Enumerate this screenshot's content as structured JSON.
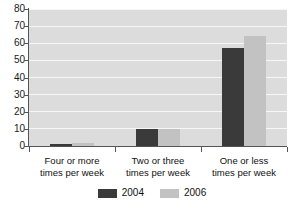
{
  "chart_data": {
    "type": "bar",
    "title": "",
    "subtitle": "",
    "xlabel": "",
    "ylabel": "",
    "ylim": [
      0,
      80
    ],
    "yticks": [
      0,
      10,
      20,
      30,
      40,
      50,
      60,
      70,
      80
    ],
    "grid": true,
    "legend_position": "bottom",
    "categories": [
      "Four or more\ntimes per week",
      "Two or three\ntimes per week",
      "One or less\ntimes per week"
    ],
    "category_lines": [
      [
        "Four or more",
        "times per week"
      ],
      [
        "Two or three",
        "times per week"
      ],
      [
        "One or less",
        "times per week"
      ]
    ],
    "series": [
      {
        "name": "2004",
        "color": "#3a3a3a",
        "values": [
          1,
          10,
          57
        ]
      },
      {
        "name": "2006",
        "color": "#c2c2c2",
        "values": [
          2,
          10,
          64
        ]
      }
    ]
  },
  "legend": {
    "entries": [
      {
        "label": "2004",
        "color": "#3a3a3a"
      },
      {
        "label": "2006",
        "color": "#c2c2c2"
      }
    ]
  },
  "style": {
    "plot_background": "#dcdcdc",
    "gridline_color": "#f7f7f7",
    "axis_color": "#555555",
    "text_color": "#111111",
    "page_background": "#ffffff"
  }
}
